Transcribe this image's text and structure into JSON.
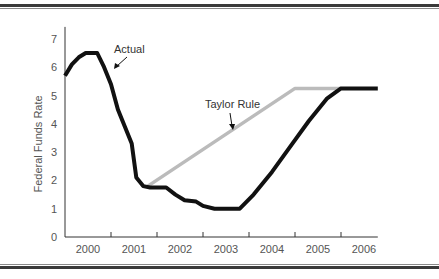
{
  "chart_data": {
    "type": "line",
    "title": "",
    "xlabel": "",
    "ylabel": "Federal Funds Rate",
    "ylim": [
      0,
      7
    ],
    "xlim": [
      2000.0,
      2006.8
    ],
    "yticks": [
      "0",
      "1",
      "2",
      "3",
      "4",
      "5",
      "6",
      "7"
    ],
    "xticks": [
      "2000",
      "2001",
      "2002",
      "2003",
      "2004",
      "2005",
      "2006"
    ],
    "grid": false,
    "legend": "inline annotations",
    "annotations": [
      {
        "text": "Actual",
        "target_series": "Actual"
      },
      {
        "text": "Taylor Rule",
        "target_series": "Taylor Rule"
      }
    ],
    "series": [
      {
        "name": "Actual",
        "color": "#111111",
        "points": [
          [
            2000.0,
            5.7
          ],
          [
            2000.15,
            6.1
          ],
          [
            2000.3,
            6.35
          ],
          [
            2000.45,
            6.5
          ],
          [
            2000.7,
            6.5
          ],
          [
            2000.85,
            6.0
          ],
          [
            2001.0,
            5.4
          ],
          [
            2001.15,
            4.5
          ],
          [
            2001.3,
            3.9
          ],
          [
            2001.45,
            3.3
          ],
          [
            2001.55,
            2.1
          ],
          [
            2001.7,
            1.8
          ],
          [
            2001.85,
            1.75
          ],
          [
            2002.2,
            1.75
          ],
          [
            2002.4,
            1.5
          ],
          [
            2002.6,
            1.3
          ],
          [
            2002.85,
            1.25
          ],
          [
            2003.0,
            1.1
          ],
          [
            2003.25,
            1.0
          ],
          [
            2003.8,
            1.0
          ],
          [
            2004.1,
            1.5
          ],
          [
            2004.5,
            2.3
          ],
          [
            2004.9,
            3.2
          ],
          [
            2005.3,
            4.1
          ],
          [
            2005.7,
            4.9
          ],
          [
            2006.0,
            5.25
          ],
          [
            2006.8,
            5.25
          ]
        ]
      },
      {
        "name": "Taylor Rule",
        "color": "#bbbbbb",
        "points": [
          [
            2001.8,
            1.8
          ],
          [
            2005.0,
            5.25
          ],
          [
            2006.0,
            5.25
          ]
        ]
      }
    ]
  }
}
